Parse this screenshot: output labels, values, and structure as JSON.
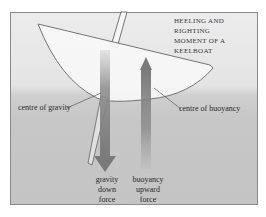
{
  "diagram": {
    "title_line1": "Heeling and righting",
    "title_line2": "moment of a keelboat",
    "labels": {
      "centre_of_gravity": "centre of gravity",
      "centre_of_buoyancy": "centre of buoyancy",
      "gravity_force": [
        "gravity",
        "down",
        "force"
      ],
      "buoyancy_force": [
        "buoyancy",
        "upward",
        "force"
      ]
    },
    "colors": {
      "sky": "#ececec",
      "water": "#c6c6c6",
      "hull_fill": "#f6f6f6",
      "outline": "#555555",
      "arrow": "#7a7a7a"
    },
    "elements": [
      "heeled hull",
      "mast",
      "keel",
      "gravity arrow (down)",
      "buoyancy arrow (up)"
    ]
  }
}
